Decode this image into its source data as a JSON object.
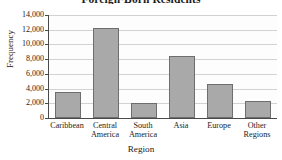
{
  "chart_data": {
    "type": "bar",
    "title": "Foreign-Born Residents",
    "xlabel": "Region",
    "ylabel": "Frequency",
    "categories": [
      "Caribbean",
      "Central America",
      "South America",
      "Asia",
      "Europe",
      "Other Regions"
    ],
    "values": [
      3500,
      12300,
      2100,
      8400,
      4600,
      2300
    ],
    "ylim": [
      0,
      14000
    ],
    "ytick_labels": [
      "0",
      "2,000",
      "4,000",
      "6,000",
      "8,000",
      "10,000",
      "12,000",
      "14,000"
    ],
    "ytick_values": [
      0,
      2000,
      4000,
      6000,
      8000,
      10000,
      12000,
      14000
    ],
    "grid": true,
    "legend": false,
    "bar_color": "#a9a9a9",
    "bar_edge_color": "#6e6e6e",
    "axis_color": "#4a4a4a",
    "grid_color": "#d2d2d2",
    "plot_background": "#fdfdfd"
  }
}
